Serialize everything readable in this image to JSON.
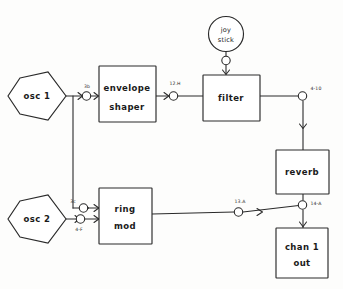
{
  "diagram": {
    "background_color": "#fdfdfc",
    "line_color": "#2a2a2a",
    "modules": [
      {
        "id": "osc1",
        "label": "osc 1",
        "shape": "hexagon"
      },
      {
        "id": "osc2",
        "label": "osc 2",
        "shape": "hexagon"
      },
      {
        "id": "envelope",
        "label_line1": "envelope",
        "label_line2": "shaper",
        "shape": "rect"
      },
      {
        "id": "ringmod",
        "label_line1": "ring",
        "label_line2": "mod",
        "shape": "rect"
      },
      {
        "id": "filter",
        "label": "filter",
        "shape": "rect"
      },
      {
        "id": "reverb",
        "label": "reverb",
        "shape": "rect"
      },
      {
        "id": "chan1out",
        "label_line1": "chan 1",
        "label_line2": "out",
        "shape": "rect"
      },
      {
        "id": "joystick",
        "label_line1": "joy",
        "label_line2": "stick",
        "shape": "circle"
      }
    ],
    "patch_points": [
      {
        "id": "p-3b",
        "label": "3b",
        "near": "envelope-input"
      },
      {
        "id": "p-12h",
        "label": "12.H",
        "near": "envelope-output"
      },
      {
        "id": "p-410",
        "label": "4-10",
        "near": "filter-output"
      },
      {
        "id": "p-3c",
        "label": "3c",
        "near": "ringmod-input-top"
      },
      {
        "id": "p-4f",
        "label": "4-F",
        "near": "osc2-output"
      },
      {
        "id": "p-13a",
        "label": "13.A",
        "near": "ringmod-output"
      },
      {
        "id": "p-14a",
        "label": "14-A",
        "near": "reverb-output"
      },
      {
        "id": "p-joy",
        "label": "",
        "near": "joystick-output"
      }
    ],
    "connections": [
      {
        "from": "osc1",
        "to": "envelope",
        "via": "3b"
      },
      {
        "from": "osc1",
        "to": "ringmod",
        "via": "3c"
      },
      {
        "from": "osc2",
        "to": "ringmod",
        "via": "4-F"
      },
      {
        "from": "envelope",
        "to": "filter",
        "via": "12.H"
      },
      {
        "from": "joystick",
        "to": "filter",
        "via": ""
      },
      {
        "from": "filter",
        "to": "reverb",
        "via": "4-10"
      },
      {
        "from": "ringmod",
        "to": "chan1out",
        "via": "13.A"
      },
      {
        "from": "reverb",
        "to": "chan1out",
        "via": "14-A"
      }
    ]
  }
}
